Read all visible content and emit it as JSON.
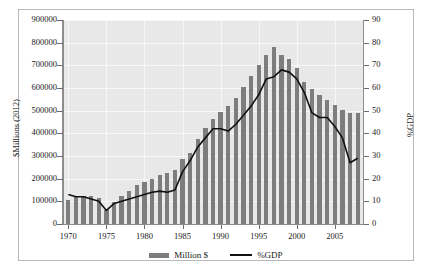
{
  "chart_data": {
    "type": "bar",
    "title": "",
    "subtitle": "",
    "xlabel": "",
    "ylabel": "$Millions (2012)",
    "y2label": "%GDP",
    "ylim": [
      0,
      900000
    ],
    "y2lim": [
      0,
      90
    ],
    "grid": true,
    "legend_position": "bottom",
    "y_ticks": [
      0,
      100000,
      200000,
      300000,
      400000,
      500000,
      600000,
      700000,
      800000,
      900000
    ],
    "y_tick_labels": [
      "0",
      "100000",
      "200000",
      "300000",
      "400000",
      "500000",
      "600000",
      "700000",
      "800000",
      "900000"
    ],
    "y2_ticks": [
      0,
      10,
      20,
      30,
      40,
      50,
      60,
      70,
      80,
      90
    ],
    "y2_tick_labels": [
      "0",
      "10",
      "20",
      "30",
      "40",
      "50",
      "60",
      "70",
      "80",
      "90"
    ],
    "x_ticks": [
      1970,
      1975,
      1980,
      1985,
      1990,
      1995,
      2000,
      2005
    ],
    "x_tick_labels": [
      "1970",
      "1975",
      "1980",
      "1985",
      "1990",
      "1995",
      "2000",
      "2005"
    ],
    "xlim": [
      1969.3,
      2008.7
    ],
    "categories": [
      1970,
      1971,
      1972,
      1973,
      1974,
      1975,
      1976,
      1977,
      1978,
      1979,
      1980,
      1981,
      1982,
      1983,
      1984,
      1985,
      1986,
      1987,
      1988,
      1989,
      1990,
      1991,
      1992,
      1993,
      1994,
      1995,
      1996,
      1997,
      1998,
      1999,
      2000,
      2001,
      2002,
      2003,
      2004,
      2005,
      2006,
      2007,
      2008
    ],
    "series": [
      {
        "name": "Million $",
        "type": "bar",
        "axis": "left",
        "color": "#7d7d7d",
        "values": [
          105000,
          120000,
          125000,
          125000,
          115000,
          60000,
          95000,
          125000,
          145000,
          170000,
          185000,
          200000,
          215000,
          225000,
          240000,
          285000,
          315000,
          375000,
          425000,
          465000,
          495000,
          520000,
          555000,
          605000,
          655000,
          700000,
          745000,
          780000,
          745000,
          730000,
          690000,
          625000,
          595000,
          570000,
          545000,
          525000,
          505000,
          490000,
          490000
        ]
      },
      {
        "name": "%GDP",
        "type": "line",
        "axis": "right",
        "color": "#111111",
        "values": [
          13,
          12,
          12,
          11,
          10,
          6,
          9,
          10,
          11,
          12,
          13,
          14,
          14.5,
          14,
          15,
          23,
          28,
          34,
          38,
          42,
          42,
          41,
          44,
          48,
          52,
          57,
          64,
          65,
          68,
          67,
          64,
          58,
          49,
          47,
          47,
          43,
          38,
          27,
          29
        ]
      }
    ],
    "legend": [
      {
        "label": "Million $",
        "marker": "bar",
        "color": "#7d7d7d"
      },
      {
        "label": "%GDP",
        "marker": "line",
        "color": "#111111"
      }
    ]
  }
}
